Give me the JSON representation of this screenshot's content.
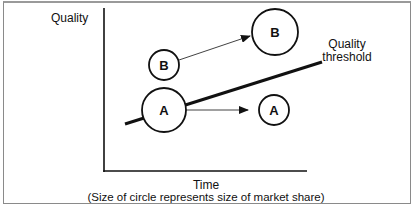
{
  "diagram": {
    "y_axis_label": "Quality",
    "x_axis_label": "Time",
    "caption": "(Size of circle represents size of market share)",
    "threshold_label_line1": "Quality",
    "threshold_label_line2": "threshold",
    "nodes": [
      {
        "id": "B-start",
        "label": "B",
        "size": "small"
      },
      {
        "id": "B-end",
        "label": "B",
        "size": "large"
      },
      {
        "id": "A-start",
        "label": "A",
        "size": "large"
      },
      {
        "id": "A-end",
        "label": "A",
        "size": "small"
      }
    ],
    "edges": [
      {
        "from": "B-start",
        "to": "B-end",
        "meaning": "B quality rises, market share grows"
      },
      {
        "from": "A-start",
        "to": "A-end",
        "meaning": "A quality flat, falls below threshold, market share shrinks"
      }
    ]
  }
}
